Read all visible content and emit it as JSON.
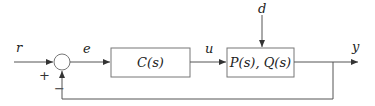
{
  "diagram": {
    "type": "feedback-control-block-diagram",
    "signals": {
      "reference": "r",
      "error": "e",
      "control": "u",
      "disturbance": "d",
      "output": "y"
    },
    "summing_junction": {
      "plus_sign": "+",
      "minus_sign": "−"
    },
    "blocks": {
      "controller": "C(s)",
      "plant": "P(s), Q(s)"
    },
    "colors": {
      "line": "#555555",
      "box_border": "#777777",
      "text": "#222222",
      "background": "#ffffff"
    }
  }
}
